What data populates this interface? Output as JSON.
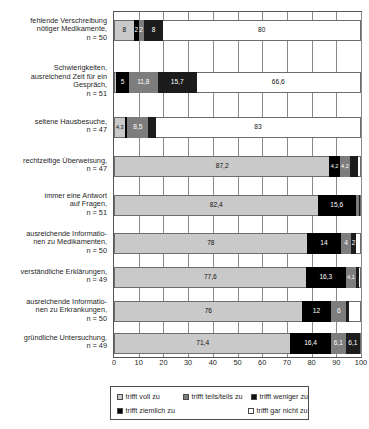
{
  "chart_data": {
    "type": "bar",
    "orientation": "horizontal",
    "stacked": true,
    "normalized_percent": true,
    "title": "",
    "subtitle": "",
    "xlabel": "",
    "ylabel": "",
    "xlim": [
      0,
      100
    ],
    "xticks": [
      0,
      10,
      20,
      30,
      40,
      50,
      60,
      70,
      80,
      90,
      100
    ],
    "xtick_labels": [
      "0",
      "10",
      "20",
      "30",
      "40",
      "50",
      "60",
      "70",
      "80",
      "90",
      "100"
    ],
    "grid": true,
    "grid_axis": "x",
    "legend_position": "bottom",
    "categories": [
      "fehlende Verschreibung nötiger Medikamente, n = 50",
      "Schwierigkeiten, ausreichend Zeit für ein Gespräch, n = 51",
      "seltene Hausbesuche, n = 47",
      "rechtzeitige Überweisung, n = 47",
      "immer eine Antwort auf Fragen, n = 51",
      "ausreichende Informationen zu Medikamenten, n = 50",
      "verständliche Erklärungen, n = 49",
      "ausreichende Informationen zu Erkrankungen, n = 50",
      "gründliche Untersuchung, n = 49"
    ],
    "category_lines": [
      [
        "fehlende Verschreibung",
        "nötiger Medikamente,",
        "n = 50"
      ],
      [
        "Schwierigkeiten,",
        "ausreichend Zeit für ein",
        "Gespräch,",
        "n = 51"
      ],
      [
        "seltene Hausbesuche,",
        "n = 47"
      ],
      [
        "rechtzeitige Überweisung,",
        "n = 47"
      ],
      [
        "immer eine Antwort",
        "auf Fragen,",
        "n = 51"
      ],
      [
        "ausreichende Informatio-",
        "nen zu Medikamenten,",
        "n = 50"
      ],
      [
        "verständliche Erklärungen,",
        "n = 49"
      ],
      [
        "ausreichende Informatio-",
        "nen zu Erkrankungen,",
        "n = 50"
      ],
      [
        "gründliche Untersuchung,",
        "n = 49"
      ]
    ],
    "series": [
      {
        "name": "trifft voll zu",
        "color": "#c9c9c9",
        "values": [
          8,
          1,
          4.3,
          87.2,
          82.4,
          78,
          77.6,
          76,
          71.4
        ],
        "labels": [
          "8",
          "1",
          "4,3",
          "87,2",
          "82,4",
          "78",
          "77,6",
          "76",
          "71,4"
        ]
      },
      {
        "name": "trifft ziemlich zu",
        "color": "#000000",
        "values": [
          2,
          5,
          1.1,
          4.2,
          15.6,
          14,
          16.3,
          12,
          16.4
        ],
        "labels": [
          "2",
          "5",
          "1,1",
          "4,2",
          "15,6",
          "14",
          "16,3",
          "12",
          "16,4"
        ]
      },
      {
        "name": "trifft teils/teils zu",
        "color": "#7d7d7d",
        "values": [
          2,
          11.8,
          8.5,
          4.2,
          1,
          4,
          4.1,
          6,
          6.1
        ],
        "labels": [
          "2",
          "11,8",
          "8,5",
          "4,2",
          "1",
          "4",
          "4,1",
          "6",
          "6,1"
        ]
      },
      {
        "name": "trifft weniger zu",
        "color": "#1c1c1c",
        "values": [
          8,
          15.7,
          3.1,
          3.4,
          1,
          2,
          1,
          1,
          6.1
        ],
        "labels": [
          "8",
          "15,7",
          "",
          "",
          "",
          "2",
          "1",
          "1",
          "6,1"
        ]
      },
      {
        "name": "trifft gar nicht zu",
        "color": "#ffffff",
        "values": [
          80,
          66.6,
          83,
          1,
          0,
          2,
          1,
          5,
          0
        ],
        "labels": [
          "80",
          "66,6",
          "83",
          "",
          "",
          "",
          "",
          "",
          ""
        ]
      }
    ]
  },
  "legend": {
    "items": [
      {
        "label": "trifft voll zu",
        "swatch": "light-gray-swatch"
      },
      {
        "label": "trifft teils/teils zu",
        "swatch": "medium-gray-swatch"
      },
      {
        "label": "trifft weniger zu",
        "swatch": "dark-swatch"
      },
      {
        "label": "trifft ziemlich zu",
        "swatch": "black-swatch"
      },
      {
        "label": "trifft gar nicht zu",
        "swatch": "white-swatch"
      }
    ]
  },
  "axis": {
    "ticks": [
      "0",
      "10",
      "20",
      "30",
      "40",
      "50",
      "60",
      "70",
      "80",
      "90",
      "100"
    ]
  },
  "bar_values": {
    "row0": {
      "segments": [
        "8",
        "22",
        "8",
        "80"
      ]
    },
    "row1": {
      "segments": [
        "15",
        "11,8",
        "15,7",
        "66,6"
      ]
    },
    "row2": {
      "segments": [
        "4,3",
        "1,1",
        "8,5",
        "83"
      ]
    },
    "row3": {
      "segments": [
        "87,2",
        "4,2"
      ]
    },
    "row4": {
      "segments": [
        "82,4",
        "15,6"
      ]
    },
    "row5": {
      "segments": [
        "78",
        "14",
        "4",
        "2"
      ]
    },
    "row6": {
      "segments": [
        "77,6",
        "16,3",
        "4,1",
        "1"
      ]
    },
    "row7": {
      "segments": [
        "76",
        "12",
        "6",
        "1"
      ]
    },
    "row8": {
      "segments": [
        "71,4",
        "16,4",
        "6,1",
        "6,1"
      ]
    }
  }
}
